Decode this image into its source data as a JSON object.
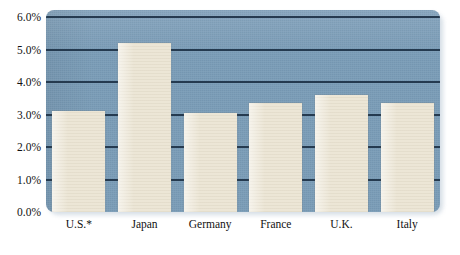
{
  "chart_data": {
    "type": "bar",
    "title": "",
    "subtitle": "",
    "xlabel": "",
    "ylabel": "",
    "categories": [
      "U.S.*",
      "Japan",
      "Germany",
      "France",
      "U.K.",
      "Italy"
    ],
    "values": [
      3.1,
      5.2,
      3.05,
      3.35,
      3.6,
      3.35
    ],
    "ylim": [
      0.0,
      6.0
    ],
    "ytick_labels": [
      "0.0%",
      "1.0%",
      "2.0%",
      "3.0%",
      "4.0%",
      "5.0%",
      "6.0%"
    ],
    "ytick_values": [
      0.0,
      1.0,
      2.0,
      3.0,
      4.0,
      5.0,
      6.0
    ],
    "grid": true,
    "legend": "none",
    "annotations": [],
    "colors": {
      "plot_background": "#7a9cb7",
      "bar_fill": "#ece6d6",
      "gridline": "#1d3246",
      "page_background": "#ffffff",
      "tick_text": "#111111"
    }
  }
}
